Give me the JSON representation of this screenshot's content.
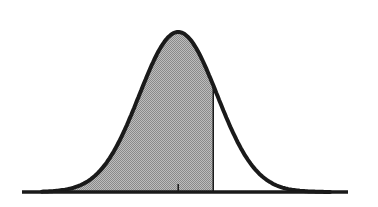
{
  "chart_data": {
    "type": "area",
    "title": "",
    "xlabel": "",
    "ylabel": "",
    "distribution": "normal",
    "mean": 0,
    "sd": 1,
    "xlim": [
      -3.5,
      3.9
    ],
    "shaded_region": {
      "from": -3.5,
      "to": 0.9,
      "description": "area under curve left of cutoff"
    },
    "cutoff_line": 0.9,
    "mean_tick": 0,
    "grid": false,
    "legend": "none",
    "colors": {
      "curve": "#1a1a1a",
      "fill": "#a8a8a8",
      "baseline": "#1a1a1a",
      "background": "#ffffff"
    }
  }
}
